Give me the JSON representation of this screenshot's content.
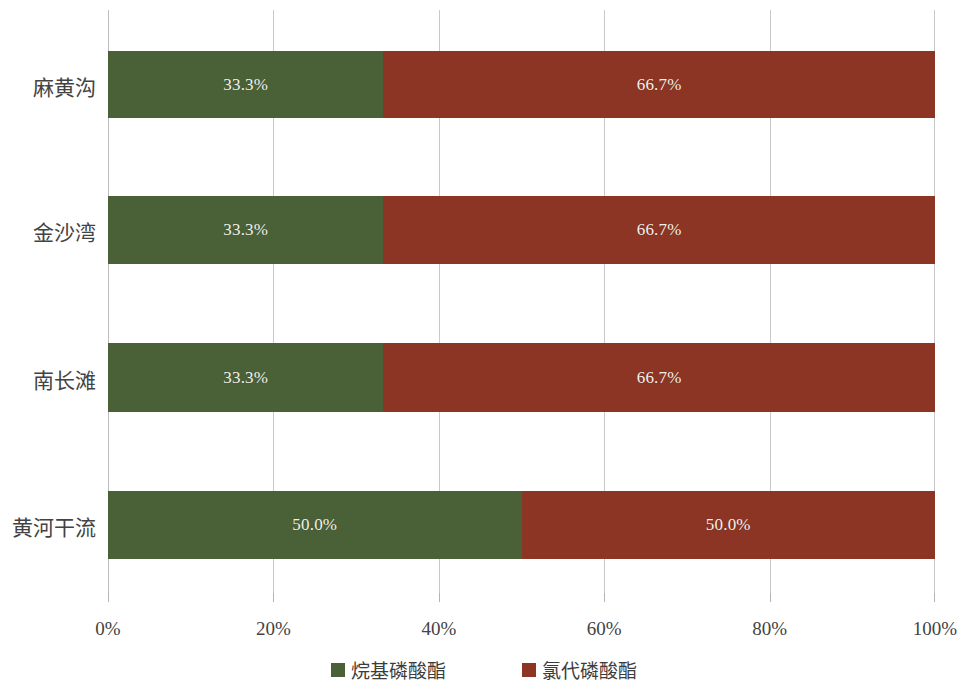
{
  "chart_data": {
    "type": "bar",
    "orientation": "horizontal",
    "stacked": true,
    "normalized": true,
    "title": "",
    "xlabel": "",
    "ylabel": "",
    "xlim": [
      0,
      100
    ],
    "grid": true,
    "legend_position": "bottom",
    "categories": [
      "黄河干流",
      "南长滩",
      "金沙湾",
      "麻黄沟"
    ],
    "categories_top_to_bottom": [
      "麻黄沟",
      "金沙湾",
      "南长滩",
      "黄河干流"
    ],
    "series": [
      {
        "name": "烷基磷酸酯",
        "color": "#4a6138",
        "values": [
          50.0,
          33.3,
          33.3,
          33.3
        ],
        "labels": [
          "50.0%",
          "33.3%",
          "33.3%",
          "33.3%"
        ]
      },
      {
        "name": "氯代磷酸酯",
        "color": "#8c3524",
        "values": [
          50.0,
          66.7,
          66.7,
          66.7
        ],
        "labels": [
          "50.0%",
          "66.7%",
          "66.7%",
          "66.7%"
        ]
      }
    ],
    "xticks": [
      0,
      20,
      40,
      60,
      80,
      100
    ],
    "xticklabels": [
      "0%",
      "20%",
      "40%",
      "60%",
      "80%",
      "100%"
    ]
  },
  "rows": [
    {
      "category": "麻黄沟",
      "top": 51,
      "height": 67,
      "segments": [
        {
          "series": "烷基磷酸酯",
          "value": 33.3,
          "label": "33.3%"
        },
        {
          "series": "氯代磷酸酯",
          "value": 66.7,
          "label": "66.7%"
        }
      ]
    },
    {
      "category": "金沙湾",
      "top": 196,
      "height": 68,
      "segments": [
        {
          "series": "烷基磷酸酯",
          "value": 33.3,
          "label": "33.3%"
        },
        {
          "series": "氯代磷酸酯",
          "value": 66.7,
          "label": "66.7%"
        }
      ]
    },
    {
      "category": "南长滩",
      "top": 343,
      "height": 69,
      "segments": [
        {
          "series": "烷基磷酸酯",
          "value": 33.3,
          "label": "33.3%"
        },
        {
          "series": "氯代磷酸酯",
          "value": 66.7,
          "label": "66.7%"
        }
      ]
    },
    {
      "category": "黄河干流",
      "top": 491,
      "height": 68,
      "segments": [
        {
          "series": "烷基磷酸酯",
          "value": 50.0,
          "label": "50.0%"
        },
        {
          "series": "氯代磷酸酯",
          "value": 50.0,
          "label": "50.0%"
        }
      ]
    }
  ],
  "axis": {
    "ticks": [
      {
        "value": 0,
        "label": "0%"
      },
      {
        "value": 20,
        "label": "20%"
      },
      {
        "value": 40,
        "label": "40%"
      },
      {
        "value": 60,
        "label": "60%"
      },
      {
        "value": 80,
        "label": "80%"
      },
      {
        "value": 100,
        "label": "100%"
      }
    ]
  },
  "legend": {
    "items": [
      {
        "label": "烷基磷酸酯",
        "color": "#4a6138"
      },
      {
        "label": "氯代磷酸酯",
        "color": "#8c3524"
      }
    ]
  },
  "colors": {
    "series_alkyl": "#4a6138",
    "series_chlorinated": "#8c3524",
    "gridline": "#c9c9c9",
    "text": "#434343",
    "bar_label_text": "#f4f1ea",
    "background": "#ffffff"
  }
}
